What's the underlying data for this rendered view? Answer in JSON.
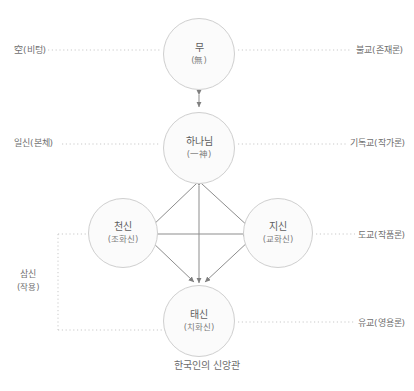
{
  "diagram": {
    "caption": "한국인의 신앙관",
    "nodes": [
      {
        "id": "mu",
        "main": "무",
        "sub": "(無)"
      },
      {
        "id": "god",
        "main": "하나님",
        "sub": "(一神)"
      },
      {
        "id": "chon",
        "main": "천신",
        "sub": "(조화신)"
      },
      {
        "id": "ji",
        "main": "지신",
        "sub": "(교화신)"
      },
      {
        "id": "tae",
        "main": "태신",
        "sub": "(치화신)"
      }
    ],
    "left_labels": [
      {
        "id": "gong",
        "text": "空(비텅)"
      },
      {
        "id": "ilsin",
        "text": "일신(본체)"
      },
      {
        "id": "samsin",
        "text": "삼신",
        "sub": "(작용)"
      }
    ],
    "right_labels": [
      {
        "id": "bulgyo",
        "text": "불교(존재론)"
      },
      {
        "id": "gidok",
        "text": "기독교(작가론)"
      },
      {
        "id": "dogyo",
        "text": "도교(작품론)"
      },
      {
        "id": "yugyo",
        "text": "유교(영용론)"
      }
    ],
    "colors": {
      "node_fill": "#fbfbfb",
      "node_stroke": "#cfcfcf",
      "arrow": "#8d8d8d",
      "dotted": "#c9c9c9",
      "text": "#6f6f6f"
    }
  }
}
